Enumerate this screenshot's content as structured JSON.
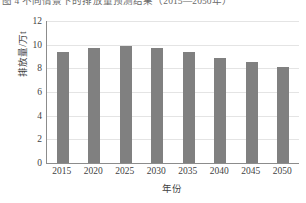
{
  "caption": {
    "text": "图 4  不同情景下的排放量预测结果（2015—2050年）"
  },
  "chart_data": {
    "type": "bar",
    "title": "",
    "xlabel": "年份",
    "ylabel": "排放量/万t",
    "categories": [
      "2015",
      "2020",
      "2025",
      "2030",
      "2035",
      "2040",
      "2045",
      "2050"
    ],
    "values": [
      9.4,
      9.75,
      9.85,
      9.7,
      9.35,
      8.85,
      8.5,
      8.1
    ],
    "ylim": [
      0,
      12
    ],
    "yticks": [
      "0",
      "2",
      "4",
      "6",
      "8",
      "10",
      "12"
    ],
    "ytick_values": [
      0,
      2,
      4,
      6,
      8,
      10,
      12
    ],
    "grid": true,
    "legend": "none",
    "bar_color": "#808080",
    "axis_color": "#8c8c8c",
    "grid_color": "#e4e4e4"
  }
}
